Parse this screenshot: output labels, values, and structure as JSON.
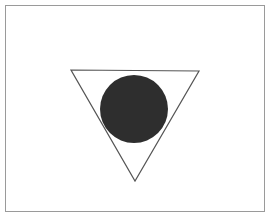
{
  "figure": {
    "title": "Dark circle inside downward-pointing triangle outline",
    "background_color": "#ffffff",
    "canvas": {
      "width": 272,
      "height": 218
    },
    "frame": {
      "name": "outer-border-rectangle",
      "x": 5,
      "y": 5,
      "width": 260,
      "height": 207,
      "stroke_color": "#9a9a9a",
      "stroke_width": 1,
      "fill_color": "#ffffff"
    },
    "shapes": [
      {
        "name": "triangle-outline",
        "type": "triangle",
        "orientation": "pointing-down",
        "points": "71,70 199,71 135,181",
        "vertices": [
          {
            "label": "top-left",
            "x": 71,
            "y": 70
          },
          {
            "label": "top-right",
            "x": 199,
            "y": 71
          },
          {
            "label": "bottom-apex",
            "x": 135,
            "y": 181
          }
        ],
        "fill_color": "none",
        "stroke_color": "#555555",
        "stroke_width": 1.2
      },
      {
        "name": "dark-circle",
        "type": "circle",
        "center_x": 134,
        "center_y": 109,
        "radius": 34,
        "fill_color": "#2e2e2e",
        "stroke_color": "none",
        "stroke_width": 0
      }
    ],
    "layering": [
      "outer-border-rectangle",
      "triangle-outline",
      "dark-circle"
    ]
  }
}
